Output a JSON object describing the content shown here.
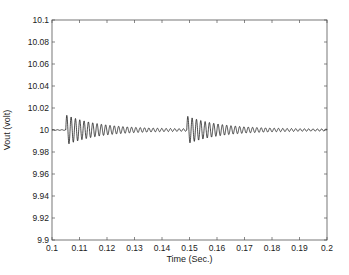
{
  "chart_data": {
    "type": "line",
    "title": "",
    "xlabel": "Time (Sec.)",
    "ylabel": "Vout (volt)",
    "xlim": [
      0.1,
      0.2
    ],
    "ylim": [
      9.9,
      10.1
    ],
    "grid": false,
    "legend": null,
    "x_ticks": [
      "0.1",
      "0.11",
      "0.12",
      "0.13",
      "0.14",
      "0.15",
      "0.16",
      "0.17",
      "0.18",
      "0.19",
      "0.2"
    ],
    "y_ticks": [
      "9.9",
      "9.92",
      "9.94",
      "9.96",
      "9.98",
      "10",
      "10.02",
      "10.04",
      "10.06",
      "10.08",
      "10.1"
    ],
    "series": [
      {
        "name": "Vout",
        "color": "#000000",
        "description": "Steady at 10 V, then damped oscillations after two disturbances",
        "baseline": 10.0,
        "events": [
          {
            "t_start": 0.105,
            "t_end": 0.149,
            "peak": 10.013,
            "trough": 9.987,
            "period": 0.00157
          },
          {
            "t_start": 0.149,
            "t_end": 0.2,
            "peak": 10.012,
            "trough": 9.988,
            "period": 0.00157
          }
        ],
        "decay_tau": 0.012,
        "residual_ripple": 0.0008
      }
    ]
  },
  "plot": {
    "left": 52,
    "right": 327,
    "top": 20,
    "bottom": 240,
    "line_color": "#000000",
    "axis_color": "#444444"
  }
}
